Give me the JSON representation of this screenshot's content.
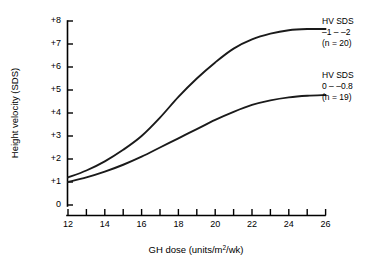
{
  "chart_data": {
    "type": "line",
    "title": "",
    "xlabel": "GH dose (units/m2/wk)",
    "xlabel_prefix": "GH dose (units/m",
    "xlabel_sup": "2",
    "xlabel_suffix": "/wk)",
    "ylabel": "Height velocity (SDS)",
    "xlim": [
      12,
      26
    ],
    "ylim": [
      0,
      8
    ],
    "x_ticks": [
      12,
      14,
      16,
      18,
      20,
      22,
      24,
      26
    ],
    "x_tick_labels": [
      "12",
      "14",
      "16",
      "18",
      "20",
      "22",
      "24",
      "26"
    ],
    "x_minor_ticks": [
      13,
      15,
      17,
      19,
      21,
      23,
      25
    ],
    "y_ticks": [
      0,
      1,
      2,
      3,
      4,
      5,
      6,
      7,
      8
    ],
    "y_tick_labels": [
      "0",
      "+1",
      "+2",
      "+3",
      "+4",
      "+5",
      "+6",
      "+7",
      "+8"
    ],
    "grid": false,
    "legend_position": "right",
    "line_color": "#1a1a1a",
    "series": [
      {
        "name": "HV SDS -1 - -2 (n = 20)",
        "legend_title": "HV SDS",
        "legend_range": "–1 – –2",
        "legend_count": "(n = 20)",
        "x": [
          12,
          13,
          14,
          15,
          16,
          17,
          18,
          19,
          20,
          21,
          22,
          23,
          24,
          25,
          26
        ],
        "values": [
          1.2,
          1.5,
          1.9,
          2.4,
          3.0,
          3.8,
          4.7,
          5.5,
          6.2,
          6.8,
          7.2,
          7.45,
          7.6,
          7.65,
          7.65
        ]
      },
      {
        "name": "HV SDS 0 - -0.8 (n = 19)",
        "legend_title": "HV SDS",
        "legend_range": "0 – –0.8",
        "legend_count": "(n = 19)",
        "x": [
          12,
          13,
          14,
          15,
          16,
          17,
          18,
          19,
          20,
          21,
          22,
          23,
          24,
          25,
          26
        ],
        "values": [
          1.0,
          1.2,
          1.45,
          1.75,
          2.1,
          2.5,
          2.9,
          3.3,
          3.7,
          4.05,
          4.35,
          4.55,
          4.68,
          4.75,
          4.78
        ]
      }
    ]
  }
}
